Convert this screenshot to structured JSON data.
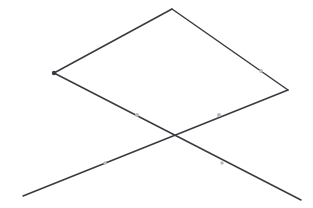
{
  "canvas": {
    "width": 313,
    "height": 208,
    "background_color": "#ffffff",
    "title": "Crossed lines over rhombus line drawing"
  },
  "style": {
    "line_color": "#3a3a42",
    "line_color_light": "#6e6e78",
    "line_width": 1.5,
    "marker_color": "#b9b9c0",
    "marker_radius": 1.8
  },
  "chart_data": {
    "type": "line",
    "title": "",
    "xlabel": "",
    "ylabel": "",
    "xlim": [
      0,
      313
    ],
    "ylim": [
      0,
      208
    ],
    "grid": false,
    "legend": "none",
    "vertices": {
      "top_apex": [
        172,
        9
      ],
      "left_vertex": [
        54,
        73
      ],
      "right_vertex": [
        288,
        90
      ],
      "crossing_point": [
        175,
        135
      ],
      "lower_left_end": [
        23,
        196
      ],
      "lower_right_end": [
        301,
        200
      ],
      "left_branch_end": [
        138,
        116
      ],
      "right_branch_end": [
        220,
        116
      ]
    },
    "series": [
      {
        "name": "upper-left-edge",
        "points": [
          [
            54,
            73
          ],
          [
            172,
            9
          ]
        ]
      },
      {
        "name": "upper-right-edge",
        "points": [
          [
            172,
            9
          ],
          [
            288,
            90
          ]
        ]
      },
      {
        "name": "lower-left-diagonal",
        "points": [
          [
            54,
            73
          ],
          [
            301,
            200
          ]
        ]
      },
      {
        "name": "lower-right-diagonal",
        "points": [
          [
            288,
            90
          ],
          [
            23,
            196
          ]
        ]
      }
    ],
    "markers": [
      {
        "name": "left-vertex-marker",
        "position": [
          54,
          73
        ],
        "kind": "node-dot",
        "color": "#3a3a42"
      },
      {
        "name": "gap-marker-upper-right",
        "position": [
          261,
          71
        ],
        "kind": "gap-dot",
        "color": "#b9b9c0"
      },
      {
        "name": "gap-marker-left-branch",
        "position": [
          137,
          115
        ],
        "kind": "gap-dot",
        "color": "#b9b9c0"
      },
      {
        "name": "gap-marker-right-branch",
        "position": [
          219,
          115
        ],
        "kind": "gap-dot",
        "color": "#b9b9c0"
      },
      {
        "name": "gap-marker-lower-left",
        "position": [
          105,
          163
        ],
        "kind": "gap-dot",
        "color": "#b9b9c0"
      },
      {
        "name": "gap-marker-lower-right",
        "position": [
          222,
          163
        ],
        "kind": "gap-dot",
        "color": "#b9b9c0"
      }
    ],
    "annotations": []
  }
}
